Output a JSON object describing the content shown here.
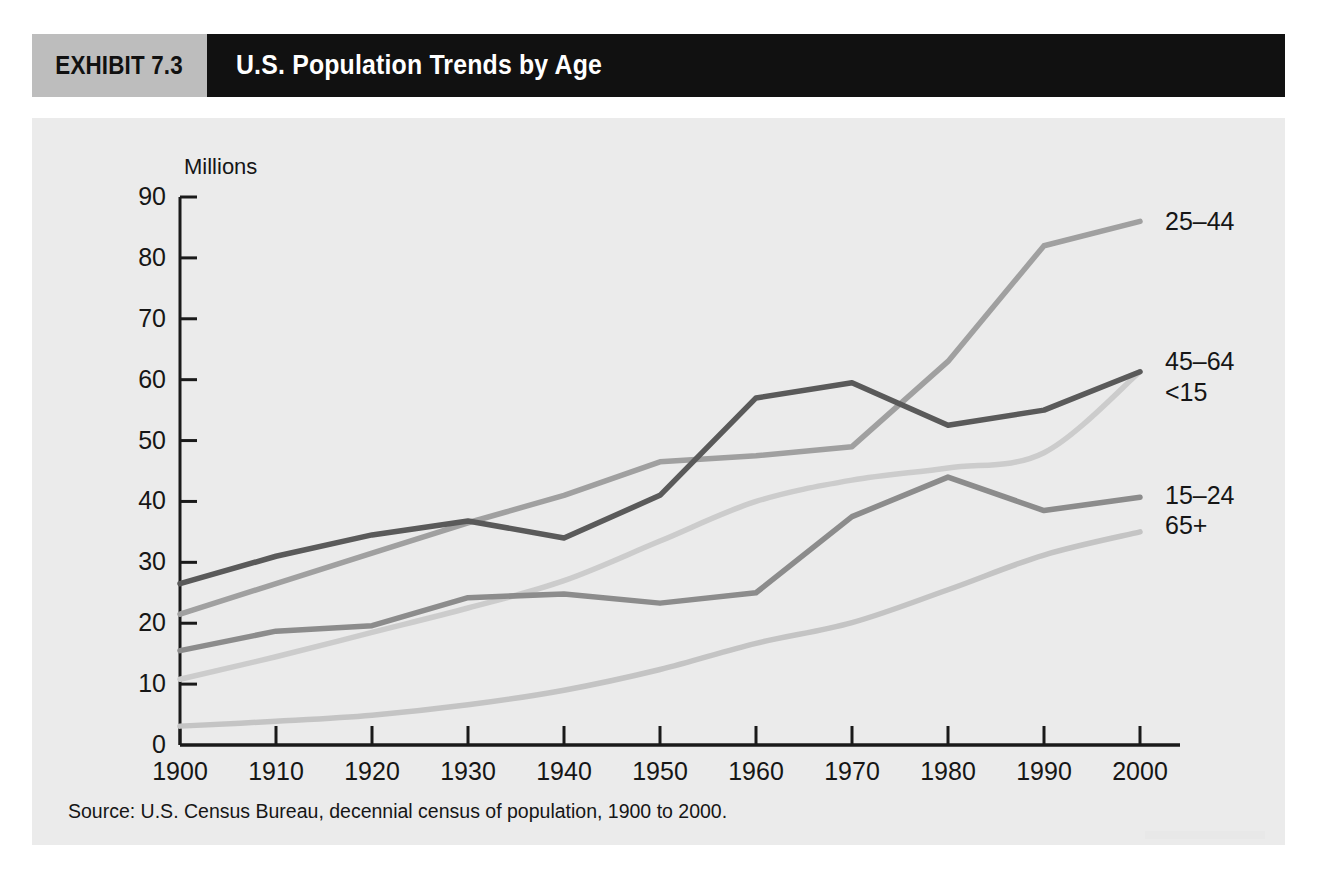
{
  "exhibit": {
    "tag": "EXHIBIT 7.3",
    "title": "U.S. Population Trends by Age"
  },
  "colors": {
    "tag_background": "#bdbdbd",
    "title_background": "#111111",
    "panel_background": "#ebebeb",
    "axis": "#1a1a1a",
    "series_45_64": "#5a5a5a",
    "series_25_44": "#a0a0a0",
    "series_15_24": "#8c8c8c",
    "series_lt15": "#cccccc",
    "series_65plus": "#c4c4c4"
  },
  "source": {
    "text": "Source: U.S. Census Bureau, decennial census of population, 1900 to 2000."
  },
  "chart_data": {
    "type": "line",
    "title": "U.S. Population Trends by Age",
    "xlabel": "",
    "ylabel": "Millions",
    "axis_unit_label": "Millions",
    "x": [
      1900,
      1910,
      1920,
      1930,
      1940,
      1950,
      1960,
      1970,
      1980,
      1990,
      2000
    ],
    "xtick_labels": [
      "1900",
      "1910",
      "1920",
      "1930",
      "1940",
      "1950",
      "1960",
      "1970",
      "1980",
      "1990",
      "2000"
    ],
    "ytick_labels": [
      "0",
      "10",
      "20",
      "30",
      "40",
      "50",
      "60",
      "70",
      "80",
      "90"
    ],
    "yticks": [
      0,
      10,
      20,
      30,
      40,
      50,
      60,
      70,
      80,
      90
    ],
    "ylim": [
      0,
      90
    ],
    "xlim": [
      1900,
      2000
    ],
    "grid": false,
    "legend_position": "right-inline-labels",
    "series": [
      {
        "name": "45-64",
        "label": "45–64",
        "color": "#5a5a5a",
        "width": 5.5,
        "label_y_value": 63.0,
        "values": [
          26.5,
          31.0,
          34.5,
          36.8,
          34.0,
          41.0,
          57.0,
          59.5,
          52.5,
          55.0,
          61.3
        ]
      },
      {
        "name": "25-44",
        "label": "25–44",
        "color": "#a0a0a0",
        "width": 5.5,
        "label_y_value": 86.0,
        "values": [
          21.5,
          26.5,
          31.5,
          36.5,
          41.0,
          46.5,
          47.5,
          49.0,
          63.0,
          82.0,
          86.0
        ]
      },
      {
        "name": "15-24",
        "label": "15–24",
        "color": "#8c8c8c",
        "width": 5.5,
        "label_y_value": 41.0,
        "values": [
          15.5,
          18.7,
          19.6,
          24.2,
          24.8,
          23.3,
          25.0,
          37.5,
          44.0,
          38.5,
          40.7
        ]
      },
      {
        "name": "<15",
        "label": "<15",
        "color": "#cccccc",
        "width": 5.5,
        "label_y_value": 58.0,
        "values": [
          10.8,
          14.5,
          18.5,
          22.5,
          27.0,
          33.5,
          40.0,
          43.5,
          45.5,
          48.0,
          61.3
        ]
      },
      {
        "name": "65+",
        "label": "65+",
        "color": "#c4c4c4",
        "width": 5.5,
        "label_y_value": 36.2,
        "values": [
          3.1,
          3.9,
          4.9,
          6.6,
          9.0,
          12.4,
          16.7,
          20.1,
          25.5,
          31.2,
          35.0
        ]
      }
    ]
  }
}
